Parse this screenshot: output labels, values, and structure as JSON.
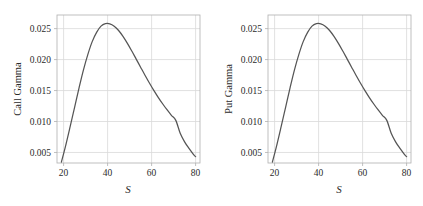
{
  "figure": {
    "background_color": "#ffffff",
    "panel_count": 2
  },
  "chart_data": [
    {
      "type": "line",
      "title": "",
      "xlabel": "S",
      "ylabel": "Call Gamma",
      "xlim": [
        17,
        82
      ],
      "ylim": [
        0.0033,
        0.0272
      ],
      "xticks": [
        20,
        40,
        60,
        80
      ],
      "xticklabels": [
        "20",
        "40",
        "60",
        "80"
      ],
      "yticks": [
        0.005,
        0.01,
        0.015,
        0.02,
        0.025
      ],
      "yticklabels": [
        "0.005",
        "0.010",
        "0.015",
        "0.020",
        "0.025"
      ],
      "grid": true,
      "legend": null,
      "line_color": "#555555",
      "grid_color": "#d9d9d9",
      "frame_color": "#b0b0b0",
      "x": [
        19,
        21,
        23,
        25,
        27,
        29,
        31,
        33,
        35,
        37,
        39,
        41,
        43,
        45,
        47,
        49,
        51,
        53,
        55,
        57,
        59,
        61,
        63,
        65,
        67,
        69,
        71,
        73,
        75,
        77,
        79,
        80
      ],
      "y": [
        0.00345,
        0.0062,
        0.0092,
        0.0123,
        0.0154,
        0.0183,
        0.0208,
        0.0229,
        0.0244,
        0.0254,
        0.0258,
        0.02578,
        0.0254,
        0.0247,
        0.02375,
        0.02262,
        0.02138,
        0.02008,
        0.01877,
        0.01747,
        0.01622,
        0.01503,
        0.01391,
        0.01287,
        0.0119,
        0.011,
        0.01018,
        0.0081,
        0.00672,
        0.00565,
        0.0047,
        0.00432
      ]
    },
    {
      "type": "line",
      "title": "",
      "xlabel": "S",
      "ylabel": "Put Gamma",
      "xlim": [
        17,
        82
      ],
      "ylim": [
        0.0033,
        0.0272
      ],
      "xticks": [
        20,
        40,
        60,
        80
      ],
      "xticklabels": [
        "20",
        "40",
        "60",
        "80"
      ],
      "yticks": [
        0.005,
        0.01,
        0.015,
        0.02,
        0.025
      ],
      "yticklabels": [
        "0.005",
        "0.010",
        "0.015",
        "0.020",
        "0.025"
      ],
      "grid": true,
      "legend": null,
      "line_color": "#555555",
      "grid_color": "#d9d9d9",
      "frame_color": "#b0b0b0",
      "x": [
        19,
        21,
        23,
        25,
        27,
        29,
        31,
        33,
        35,
        37,
        39,
        41,
        43,
        45,
        47,
        49,
        51,
        53,
        55,
        57,
        59,
        61,
        63,
        65,
        67,
        69,
        71,
        73,
        75,
        77,
        79,
        80
      ],
      "y": [
        0.00345,
        0.0062,
        0.0092,
        0.0123,
        0.0154,
        0.0183,
        0.0208,
        0.0229,
        0.0244,
        0.0254,
        0.0258,
        0.02578,
        0.0254,
        0.0247,
        0.02375,
        0.02262,
        0.02138,
        0.02008,
        0.01877,
        0.01747,
        0.01622,
        0.01503,
        0.01391,
        0.01287,
        0.0119,
        0.011,
        0.01018,
        0.0081,
        0.00672,
        0.00565,
        0.0047,
        0.00432
      ]
    }
  ]
}
